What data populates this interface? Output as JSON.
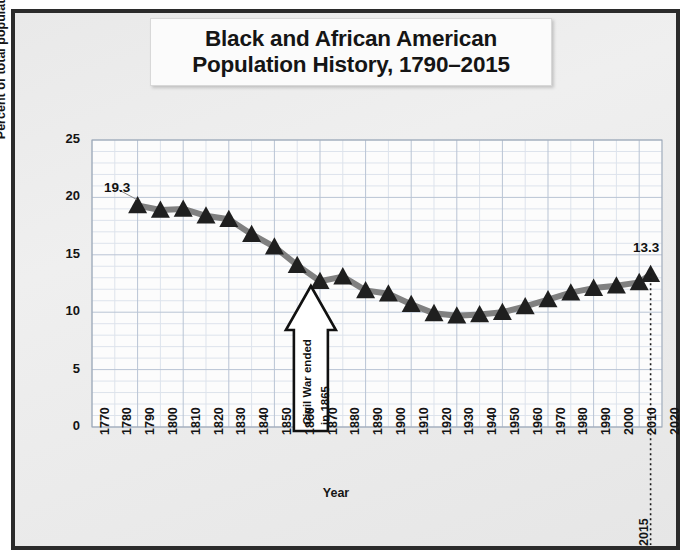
{
  "title": {
    "line1": "Black and African American",
    "line2": "Population History, 1790–2015"
  },
  "axis": {
    "ylabel": "Percent of total population",
    "xlabel": "Year",
    "yticks": [
      "0",
      "5",
      "10",
      "15",
      "20",
      "25"
    ],
    "xticks": [
      "1770",
      "1780",
      "1790",
      "1800",
      "1810",
      "1820",
      "1830",
      "1840",
      "1850",
      "1860",
      "1870",
      "1880",
      "1890",
      "1900",
      "1910",
      "1920",
      "1930",
      "1940",
      "1950",
      "1960",
      "1970",
      "1980",
      "1990",
      "2000",
      "2010",
      "2020"
    ]
  },
  "annotations": {
    "first_value_label": "19.3",
    "last_value_label": "13.3",
    "last_year_label": "2015",
    "callout_line1": "Civil War ended",
    "callout_line2": "in 1865"
  },
  "colors": {
    "frame": "#2b2b2b",
    "background": "#ececec",
    "line": "#808080",
    "marker": "#1f1f1f",
    "grid_major": "#b9c4d4",
    "grid_minor": "#dde3ec",
    "plot_bg": "#fcfcfc",
    "text": "#141414"
  },
  "chart_data": {
    "type": "line",
    "title": "Black and African American Population History, 1790–2015",
    "xlabel": "Year",
    "ylabel": "Percent of total population",
    "xlim": [
      1770,
      2020
    ],
    "ylim": [
      0,
      25
    ],
    "grid": true,
    "legend": "none",
    "marker": "triangle",
    "x": [
      1790,
      1800,
      1810,
      1820,
      1830,
      1840,
      1850,
      1860,
      1870,
      1880,
      1890,
      1900,
      1910,
      1920,
      1930,
      1940,
      1950,
      1960,
      1970,
      1980,
      1990,
      2000,
      2010,
      2015
    ],
    "values": [
      19.3,
      18.9,
      19.0,
      18.4,
      18.1,
      16.8,
      15.7,
      14.1,
      12.7,
      13.1,
      11.9,
      11.6,
      10.7,
      9.9,
      9.7,
      9.8,
      10.0,
      10.5,
      11.1,
      11.7,
      12.1,
      12.3,
      12.6,
      13.3
    ],
    "series": [
      {
        "name": "Percent of total population",
        "values": [
          19.3,
          18.9,
          19.0,
          18.4,
          18.1,
          16.8,
          15.7,
          14.1,
          12.7,
          13.1,
          11.9,
          11.6,
          10.7,
          9.9,
          9.7,
          9.8,
          10.0,
          10.5,
          11.1,
          11.7,
          12.1,
          12.3,
          12.6,
          13.3
        ]
      }
    ],
    "point_labels": [
      {
        "x": 1790,
        "label": "19.3"
      },
      {
        "x": 2015,
        "label": "13.3"
      }
    ],
    "callout": {
      "text": "Civil War ended in 1865",
      "x": 1865,
      "shape": "up-arrow"
    }
  }
}
